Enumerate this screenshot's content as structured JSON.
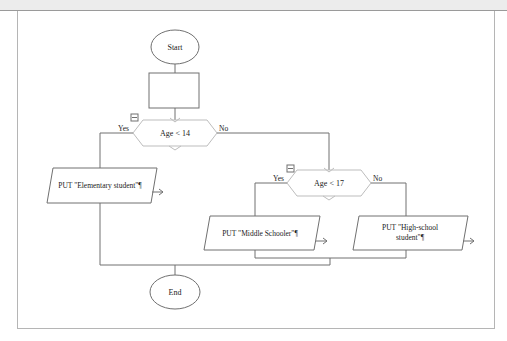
{
  "diagram": {
    "type": "flowchart",
    "nodes": {
      "start": {
        "label": "Start",
        "shape": "terminator"
      },
      "process": {
        "label": "",
        "shape": "process"
      },
      "decision1": {
        "label": "Age < 14",
        "shape": "decision",
        "yes_label": "Yes",
        "no_label": "No"
      },
      "output_elementary": {
        "label": "PUT \"Elementary student\"¶",
        "shape": "io"
      },
      "decision2": {
        "label": "Age < 17",
        "shape": "decision",
        "yes_label": "Yes",
        "no_label": "No"
      },
      "output_middle": {
        "label": "PUT \"Middle Schooler\"¶",
        "shape": "io"
      },
      "output_high_line1": {
        "label": "PUT \"High-school"
      },
      "output_high_line2": {
        "label": "student\"¶"
      },
      "end": {
        "label": "End",
        "shape": "terminator"
      }
    },
    "edges": [
      {
        "from": "start",
        "to": "process"
      },
      {
        "from": "process",
        "to": "decision1"
      },
      {
        "from": "decision1",
        "to": "output_elementary",
        "label": "Yes"
      },
      {
        "from": "decision1",
        "to": "decision2",
        "label": "No"
      },
      {
        "from": "decision2",
        "to": "output_middle",
        "label": "Yes"
      },
      {
        "from": "decision2",
        "to": "output_high",
        "label": "No"
      },
      {
        "from": "output_elementary",
        "to": "end"
      },
      {
        "from": "output_middle",
        "to": "end"
      },
      {
        "from": "output_high",
        "to": "end"
      }
    ],
    "collapse_icon": "minus-box-icon",
    "colors": {
      "stroke": "#6e6e6e",
      "decision_stroke": "#b8b8b8",
      "text": "#222222"
    }
  }
}
